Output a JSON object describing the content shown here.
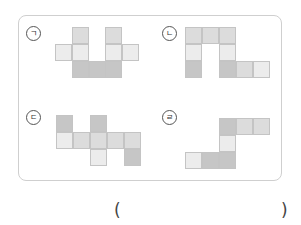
{
  "figures": [
    {
      "label": "㉠",
      "cells": [
        {
          "x": 72,
          "y": 27,
          "s": "c2"
        },
        {
          "x": 105,
          "y": 27,
          "s": "c2"
        },
        {
          "x": 55,
          "y": 44,
          "s": "c1"
        },
        {
          "x": 72,
          "y": 44,
          "s": "c1"
        },
        {
          "x": 105,
          "y": 44,
          "s": "c1"
        },
        {
          "x": 122,
          "y": 44,
          "s": "c1"
        },
        {
          "x": 72,
          "y": 61,
          "s": "c3"
        },
        {
          "x": 89,
          "y": 61,
          "s": "c3"
        },
        {
          "x": 105,
          "y": 61,
          "s": "c3"
        }
      ]
    },
    {
      "label": "㉡",
      "cells": [
        {
          "x": 185,
          "y": 27,
          "s": "c2"
        },
        {
          "x": 202,
          "y": 27,
          "s": "c2"
        },
        {
          "x": 219,
          "y": 27,
          "s": "c2"
        },
        {
          "x": 185,
          "y": 44,
          "s": "c1"
        },
        {
          "x": 219,
          "y": 44,
          "s": "c1"
        },
        {
          "x": 185,
          "y": 61,
          "s": "c3"
        },
        {
          "x": 219,
          "y": 61,
          "s": "c3"
        },
        {
          "x": 236,
          "y": 61,
          "s": "c2"
        },
        {
          "x": 253,
          "y": 61,
          "s": "c1"
        }
      ]
    },
    {
      "label": "㉢",
      "cells": [
        {
          "x": 56,
          "y": 115,
          "s": "c3"
        },
        {
          "x": 90,
          "y": 115,
          "s": "c3"
        },
        {
          "x": 56,
          "y": 132,
          "s": "c1"
        },
        {
          "x": 73,
          "y": 132,
          "s": "c2"
        },
        {
          "x": 90,
          "y": 132,
          "s": "c2"
        },
        {
          "x": 107,
          "y": 132,
          "s": "c2"
        },
        {
          "x": 124,
          "y": 132,
          "s": "c2"
        },
        {
          "x": 90,
          "y": 149,
          "s": "c1"
        },
        {
          "x": 124,
          "y": 149,
          "s": "c3"
        }
      ]
    },
    {
      "label": "㉣",
      "cells": [
        {
          "x": 219,
          "y": 118,
          "s": "c3"
        },
        {
          "x": 236,
          "y": 118,
          "s": "c2"
        },
        {
          "x": 253,
          "y": 118,
          "s": "c2"
        },
        {
          "x": 219,
          "y": 135,
          "s": "c1"
        },
        {
          "x": 185,
          "y": 152,
          "s": "c1"
        },
        {
          "x": 202,
          "y": 152,
          "s": "c3"
        },
        {
          "x": 219,
          "y": 152,
          "s": "c3"
        }
      ]
    }
  ],
  "labels": {
    "a": "ㄱ",
    "b": "ㄴ",
    "c": "ㄷ",
    "d": "ㄹ"
  },
  "answer": {
    "open": "(",
    "close": ")",
    "value": ""
  }
}
